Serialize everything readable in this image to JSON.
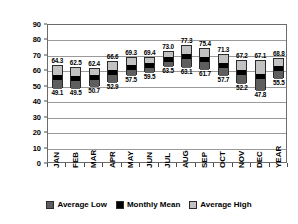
{
  "chart_data": {
    "type": "bar",
    "title": "",
    "xlabel": "",
    "ylabel": "Temperature (°F)",
    "ylim": [
      0,
      90
    ],
    "ytick_step": 10,
    "yticks": [
      "0",
      "10",
      "20",
      "30",
      "40",
      "50",
      "60",
      "70",
      "80",
      "90"
    ],
    "grid": true,
    "grid_axis": "y",
    "legend_position": "bottom",
    "bar_style": "floating-range-with-mean",
    "categories": [
      "JAN",
      "FEB",
      "MAR",
      "APR",
      "MAY",
      "JUN",
      "JUL",
      "AUG",
      "SEP",
      "OCT",
      "NOV",
      "DEC",
      "YEAR"
    ],
    "series": [
      {
        "name": "Average Low",
        "color": "#5e5e5e",
        "values": [
          49.1,
          49.5,
          50.7,
          52.9,
          57.5,
          59.5,
          63.5,
          63.1,
          61.7,
          57.7,
          52.2,
          47.8,
          55.5
        ]
      },
      {
        "name": "Monthly Mean",
        "color": "#000000",
        "values": [
          56.7,
          56.0,
          56.6,
          59.8,
          63.4,
          64.5,
          68.3,
          70.2,
          68.6,
          64.5,
          59.7,
          57.5,
          62.2
        ]
      },
      {
        "name": "Average High",
        "color": "#c2c2c2",
        "values": [
          64.3,
          62.5,
          62.4,
          66.6,
          69.3,
          69.4,
          73.0,
          77.3,
          75.4,
          71.3,
          67.2,
          67.1,
          68.8
        ]
      }
    ],
    "high_labels": [
      "64.3",
      "62.5",
      "62.4",
      "66.6",
      "69.3",
      "69.4",
      "73.0",
      "77.3",
      "75.4",
      "71.3",
      "67.2",
      "67.1",
      "68.8"
    ],
    "low_labels": [
      "49.1",
      "49.5",
      "50.7",
      "52.9",
      "57.5",
      "59.5",
      "63.5",
      "63.1",
      "61.7",
      "57.7",
      "52.2",
      "47.8",
      "55.5"
    ]
  },
  "legend": {
    "items": [
      {
        "label": "Average Low",
        "color": "#5e5e5e"
      },
      {
        "label": "Monthly Mean",
        "color": "#000000"
      },
      {
        "label": "Average High",
        "color": "#c2c2c2"
      }
    ]
  }
}
